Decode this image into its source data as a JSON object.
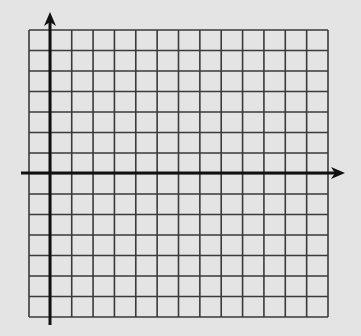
{
  "diagram": {
    "type": "coordinate-grid",
    "background_color": "#e4e4e4",
    "grid": {
      "columns": 14,
      "rows": 14,
      "left": 29,
      "top": 30,
      "right": 328,
      "bottom": 317,
      "line_color": "#3a3a3a",
      "line_width": 1.6
    },
    "axes": {
      "color": "#111111",
      "width": 3,
      "y_axis": {
        "x": 50,
        "y_start": 325,
        "y_end": 12,
        "arrow": "up"
      },
      "x_axis": {
        "y": 173,
        "x_start": 21,
        "x_end": 345,
        "arrow": "right"
      }
    },
    "labels": []
  }
}
